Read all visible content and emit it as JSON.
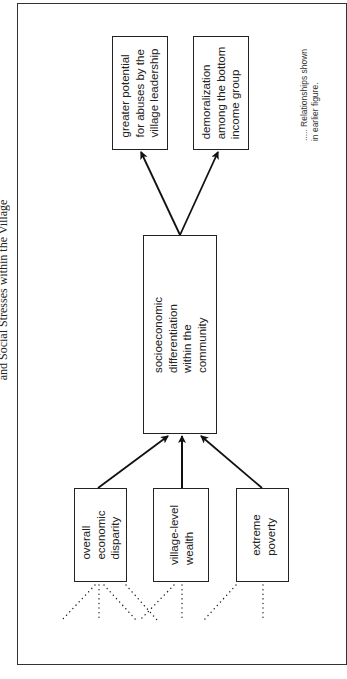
{
  "title": "and Social Stresses within the Village",
  "diagram": {
    "orientation": "rotated-90-ccw",
    "nodes": {
      "abuses": {
        "label": "greater potential\nfor abuses by the\nvillage leadership"
      },
      "demoralization": {
        "label": "demoralization\namong the bottom\nincome group"
      },
      "differentiation": {
        "label": "socioeconomic\ndifferentiation\nwithin the\ncommunity"
      },
      "disparity": {
        "label": "overall\neconomic\ndisparity"
      },
      "wealth": {
        "label": "village-level\nwealth"
      },
      "poverty": {
        "label": "extreme\npoverty"
      }
    },
    "edges": [
      {
        "from": "disparity",
        "to": "differentiation",
        "style": "solid-arrow"
      },
      {
        "from": "wealth",
        "to": "differentiation",
        "style": "solid-arrow"
      },
      {
        "from": "poverty",
        "to": "differentiation",
        "style": "solid-arrow"
      },
      {
        "from": "differentiation",
        "to": "abuses",
        "style": "solid-arrow"
      },
      {
        "from": "differentiation",
        "to": "demoralization",
        "style": "solid-arrow"
      }
    ],
    "legend": {
      "symbol": ".....",
      "text": "Relationships shown\nin earlier figure.",
      "full": "..... Relationships shown\nin earlier figure."
    }
  }
}
